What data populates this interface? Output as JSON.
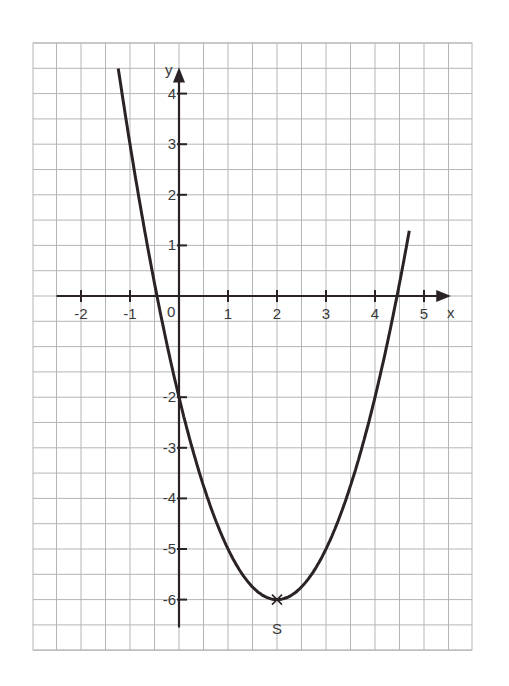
{
  "chart_data": {
    "type": "line",
    "title": "",
    "xlabel": "x",
    "ylabel": "y",
    "xlim": [
      -2.9,
      6.0
    ],
    "ylim": [
      -7.0,
      5.0
    ],
    "grid": true,
    "grid_step": 0.5,
    "x_ticks": [
      -2,
      -1,
      1,
      2,
      3,
      4,
      5
    ],
    "x_tick_labels": [
      "-2",
      "-1",
      "1",
      "2",
      "3",
      "4",
      "5"
    ],
    "y_ticks": [
      4,
      3,
      2,
      1,
      -2,
      -3,
      -4,
      -5,
      -6
    ],
    "y_tick_labels": [
      "4",
      "3",
      "2",
      "1",
      "-2",
      "-3",
      "-4",
      "-5",
      "-6"
    ],
    "origin_label": "0",
    "series": [
      {
        "name": "parabola",
        "function": "y = (x - 2)^2 - 6",
        "x_range": [
          -1.24,
          4.7
        ],
        "points": [
          [
            -1.2,
            4.24
          ],
          [
            -1,
            3
          ],
          [
            -0.5,
            0.25
          ],
          [
            0,
            -2
          ],
          [
            0.5,
            -3.75
          ],
          [
            1,
            -5
          ],
          [
            1.5,
            -5.75
          ],
          [
            2,
            -6
          ],
          [
            2.5,
            -5.75
          ],
          [
            3,
            -5
          ],
          [
            3.5,
            -3.75
          ],
          [
            4,
            -2
          ],
          [
            4.5,
            0.25
          ],
          [
            4.7,
            1.29
          ]
        ]
      }
    ],
    "annotations": [
      {
        "label": "S",
        "x": 2,
        "y": -6,
        "marker": "x",
        "position": "below"
      }
    ]
  }
}
